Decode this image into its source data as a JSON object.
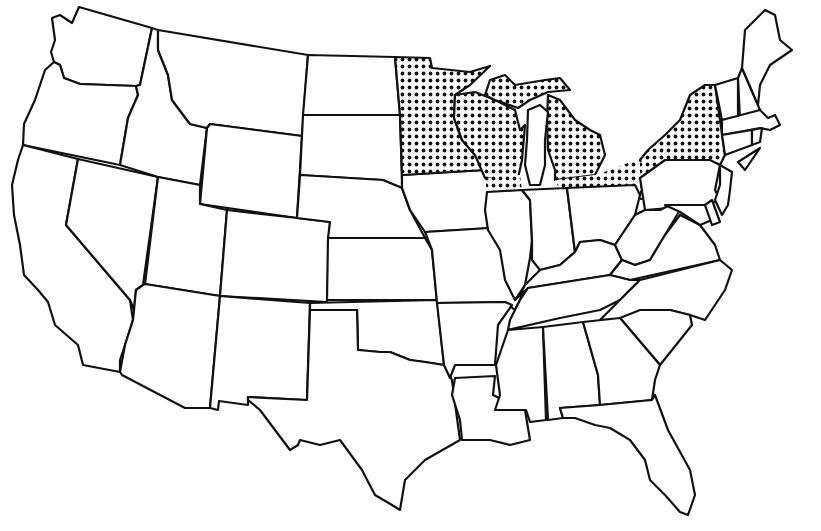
{
  "map": {
    "type": "outline-map",
    "region": "Contiguous United States",
    "style": {
      "outline_color": "#111111",
      "background": "#ffffff",
      "highlight_pattern": "dot-grid",
      "highlight_dot_color": "#111111"
    },
    "highlighted_regions": [
      "Minnesota",
      "Wisconsin",
      "Michigan",
      "New York",
      "Northern Illinois (strip)",
      "Northern Indiana (strip)",
      "Northern Ohio (strip)",
      "Northwestern Pennsylvania"
    ],
    "unhighlighted_states": [
      "Washington",
      "Oregon",
      "California",
      "Nevada",
      "Idaho",
      "Montana",
      "Wyoming",
      "Utah",
      "Arizona",
      "Colorado",
      "New Mexico",
      "North Dakota",
      "South Dakota",
      "Nebraska",
      "Kansas",
      "Oklahoma",
      "Texas",
      "Iowa",
      "Missouri",
      "Arkansas",
      "Louisiana",
      "Illinois",
      "Indiana",
      "Ohio",
      "Kentucky",
      "Tennessee",
      "Mississippi",
      "Alabama",
      "Georgia",
      "Florida",
      "South Carolina",
      "North Carolina",
      "Virginia",
      "West Virginia",
      "Maryland",
      "Delaware",
      "New Jersey",
      "Pennsylvania",
      "Connecticut",
      "Rhode Island",
      "Massachusetts",
      "Vermont",
      "New Hampshire",
      "Maine"
    ],
    "labels": []
  }
}
